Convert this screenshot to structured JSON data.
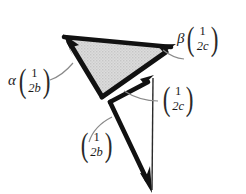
{
  "figure": {
    "type": "vector-diagram",
    "background_color": "#ffffff",
    "stroke_color": "#111111",
    "shade_color": "#d5d5d5",
    "leader_color": "#7a7a7a",
    "labels": {
      "alpha": {
        "coefficient": "α",
        "vector_top": "1",
        "vector_bottom": "2b"
      },
      "beta": {
        "coefficient": "β",
        "vector_top": "1",
        "vector_bottom": "2c"
      },
      "middle": {
        "coefficient": "",
        "vector_top": "1",
        "vector_bottom": "2c"
      },
      "bottom": {
        "coefficient": "",
        "vector_top": "1",
        "vector_bottom": "2b"
      }
    },
    "geometry": {
      "shaded_triangle": {
        "apex_left": [
          64,
          36
        ],
        "apex_right": [
          172,
          47
        ],
        "apex_bottom": [
          101,
          96
        ]
      },
      "vectors": [
        {
          "name": "alpha-vector",
          "from": [
            101,
            96
          ],
          "to": [
            64,
            36
          ],
          "arrowhead": true,
          "weight": "thick"
        },
        {
          "name": "beta-vector",
          "from": [
            101,
            96
          ],
          "to": [
            172,
            47
          ],
          "arrowhead": true,
          "weight": "thick"
        },
        {
          "name": "shaded-top-edge",
          "from": [
            64,
            36
          ],
          "to": [
            172,
            47
          ],
          "arrowhead": false,
          "weight": "thick"
        },
        {
          "name": "inner-c-vector",
          "from": [
            110,
            102
          ],
          "to": [
            153,
            76
          ],
          "arrowhead": true,
          "weight": "thick"
        },
        {
          "name": "inner-b-vector",
          "from": [
            110,
            102
          ],
          "to": [
            152,
            191
          ],
          "arrowhead": true,
          "weight": "thick"
        },
        {
          "name": "vertical-c-edge",
          "from": [
            153,
            78
          ],
          "to": [
            152,
            191
          ],
          "arrowhead": false,
          "weight": "thin"
        }
      ],
      "leader_arcs": [
        {
          "name": "alpha-leader",
          "from": [
            52,
            78
          ],
          "to": [
            82,
            57
          ]
        },
        {
          "name": "beta-leader",
          "from": [
            183,
            58
          ],
          "to": [
            160,
            52
          ]
        },
        {
          "name": "middle-leader",
          "from": [
            157,
            100
          ],
          "to": [
            120,
            92
          ]
        },
        {
          "name": "bottom-leader",
          "from": [
            90,
            141
          ],
          "to": [
            117,
            119
          ]
        }
      ]
    }
  }
}
